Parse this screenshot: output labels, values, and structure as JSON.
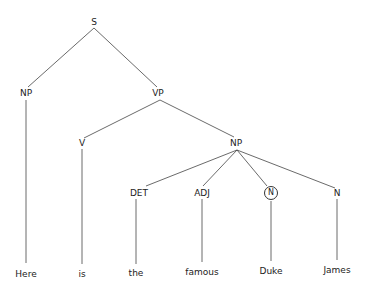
{
  "diagram": {
    "type": "syntax-tree",
    "nodes": [
      {
        "id": "S",
        "label": "S",
        "x": 94,
        "y": 22
      },
      {
        "id": "NP1",
        "label": "NP",
        "x": 26,
        "y": 93
      },
      {
        "id": "VP",
        "label": "VP",
        "x": 158,
        "y": 93
      },
      {
        "id": "V",
        "label": "V",
        "x": 82,
        "y": 143
      },
      {
        "id": "NP2",
        "label": "NP",
        "x": 236,
        "y": 143
      },
      {
        "id": "DET",
        "label": "DET",
        "x": 139,
        "y": 193
      },
      {
        "id": "ADJ",
        "label": "ADJ",
        "x": 202,
        "y": 193
      },
      {
        "id": "N1",
        "label": "N",
        "x": 271,
        "y": 193,
        "circled": true
      },
      {
        "id": "N2",
        "label": "N",
        "x": 337,
        "y": 193
      }
    ],
    "words": [
      {
        "text": "Here",
        "x": 26,
        "y": 274
      },
      {
        "text": "is",
        "x": 82,
        "y": 274
      },
      {
        "text": "the",
        "x": 136,
        "y": 273
      },
      {
        "text": "famous",
        "x": 202,
        "y": 272
      },
      {
        "text": "Duke",
        "x": 271,
        "y": 271
      },
      {
        "text": "James",
        "x": 337,
        "y": 270
      }
    ],
    "edges": [
      [
        94,
        28,
        28,
        87
      ],
      [
        94,
        28,
        157,
        87
      ],
      [
        160,
        100,
        84,
        138
      ],
      [
        160,
        100,
        234,
        137
      ],
      [
        237,
        150,
        146,
        186
      ],
      [
        237,
        150,
        203,
        186
      ],
      [
        237,
        150,
        267,
        186
      ],
      [
        237,
        150,
        335,
        188
      ],
      [
        26,
        100,
        26,
        263
      ],
      [
        82,
        149,
        82,
        264
      ],
      [
        136,
        199,
        136,
        264
      ],
      [
        202,
        199,
        202,
        262
      ],
      [
        271,
        201,
        271,
        261
      ],
      [
        337,
        199,
        337,
        260
      ]
    ]
  }
}
